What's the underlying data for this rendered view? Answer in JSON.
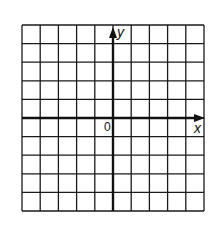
{
  "diagram": {
    "type": "coordinate-grid",
    "grid": {
      "columns": 10,
      "rows": 10,
      "left": 22,
      "top": 25,
      "right": 204,
      "bottom": 211,
      "line_color": "#1a1a1a"
    },
    "axes": {
      "x_axis_row": 5,
      "y_axis_col": 5,
      "x_label": "x",
      "y_label": "y",
      "origin_label": "0",
      "axis_color": "#111111"
    }
  }
}
